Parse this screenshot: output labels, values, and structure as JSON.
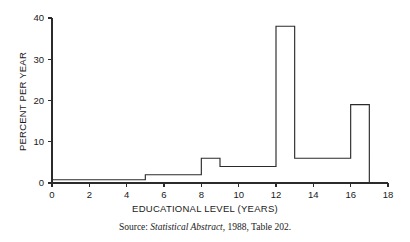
{
  "figure": {
    "ylabel": "PERCENT PER YEAR",
    "xlabel": "EDUCATIONAL LEVEL (YEARS)",
    "source_prefix": "Source:",
    "source_title": "Statistical Abstract",
    "source_suffix": ", 1988, Table 202."
  },
  "chart_data": {
    "type": "bar",
    "subtype": "histogram",
    "title": "",
    "xlabel": "EDUCATIONAL LEVEL (YEARS)",
    "ylabel": "PERCENT PER YEAR",
    "xlim": [
      0,
      18
    ],
    "ylim": [
      0,
      40
    ],
    "xticks": [
      0,
      2,
      4,
      6,
      8,
      10,
      12,
      14,
      16,
      18
    ],
    "yticks": [
      0,
      10,
      20,
      30,
      40
    ],
    "xtick_labels": [
      "0",
      "2",
      "4",
      "6",
      "8",
      "10",
      "12",
      "14",
      "16",
      "18"
    ],
    "ytick_labels": [
      "0",
      "10",
      "20",
      "30",
      "40"
    ],
    "grid": false,
    "legend": null,
    "bin_edges": [
      0,
      5,
      8,
      9,
      12,
      13,
      16,
      17
    ],
    "values": [
      0.8,
      2,
      6,
      4,
      38,
      6,
      19
    ],
    "bins": [
      {
        "start": 0,
        "end": 5,
        "height": 0.8
      },
      {
        "start": 5,
        "end": 8,
        "height": 2
      },
      {
        "start": 8,
        "end": 9,
        "height": 6
      },
      {
        "start": 9,
        "end": 12,
        "height": 4
      },
      {
        "start": 12,
        "end": 13,
        "height": 38
      },
      {
        "start": 13,
        "end": 16,
        "height": 6
      },
      {
        "start": 16,
        "end": 17,
        "height": 19
      }
    ],
    "source_note": "Source: Statistical Abstract, 1988, Table 202."
  }
}
